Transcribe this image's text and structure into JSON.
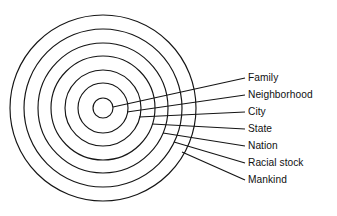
{
  "figure": {
    "type": "concentric-circle-diagram",
    "background_color": "#ffffff",
    "stroke_color": "#151515",
    "text_color": "#111111",
    "ring_count": 7,
    "label_count": 7
  },
  "diagram": {
    "center_x": 103,
    "center_y": 108,
    "rings": [
      {
        "index": 1,
        "label": "Family",
        "radius": 10
      },
      {
        "index": 2,
        "label": "Neighborhood",
        "radius": 25
      },
      {
        "index": 3,
        "label": "City",
        "radius": 38
      },
      {
        "index": 4,
        "label": "State",
        "radius": 52
      },
      {
        "index": 5,
        "label": "Nation",
        "radius": 65
      },
      {
        "index": 6,
        "label": "Racial stock",
        "radius": 79
      },
      {
        "index": 7,
        "label": "Mankind",
        "radius": 93
      }
    ]
  },
  "labels": [
    {
      "id": "label-family",
      "text": "Family",
      "x": 248,
      "y": 78,
      "leader_start_x": 113,
      "leader_start_y": 107
    },
    {
      "id": "label-neighborhood",
      "text": "Neighborhood",
      "x": 248,
      "y": 95,
      "leader_start_x": 127,
      "leader_start_y": 112
    },
    {
      "id": "label-city",
      "text": "City",
      "x": 248,
      "y": 112,
      "leader_start_x": 139,
      "leader_start_y": 117
    },
    {
      "id": "label-state",
      "text": "State",
      "x": 248,
      "y": 129,
      "leader_start_x": 152,
      "leader_start_y": 124
    },
    {
      "id": "label-nation",
      "text": "Nation",
      "x": 248,
      "y": 146,
      "leader_start_x": 163,
      "leader_start_y": 133
    },
    {
      "id": "label-racial-stock",
      "text": "Racial stock",
      "x": 248,
      "y": 163,
      "leader_start_x": 174,
      "leader_start_y": 142
    },
    {
      "id": "label-mankind",
      "text": "Mankind",
      "x": 248,
      "y": 180,
      "leader_start_x": 182,
      "leader_start_y": 152
    }
  ],
  "leader_end_x": 245
}
